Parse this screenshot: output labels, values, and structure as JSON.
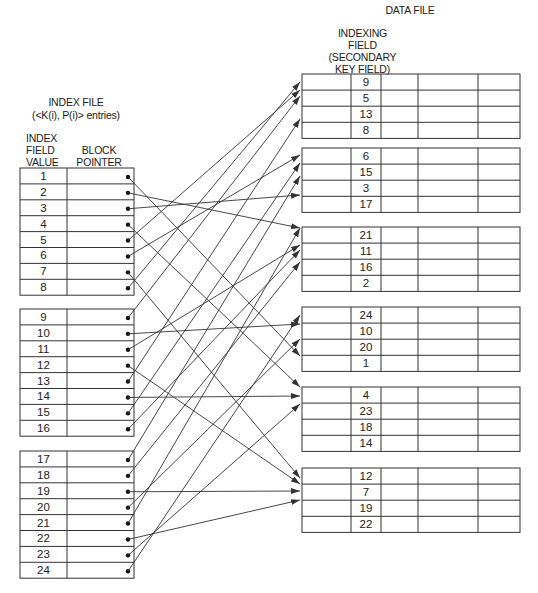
{
  "labels": {
    "data_file": "DATA FILE",
    "indexing_field": [
      "INDEXING",
      "FIELD",
      "(SECONDARY",
      "KEY FIELD)"
    ],
    "index_file": "INDEX FILE",
    "index_entries": "(<K(i), P(i)> entries)",
    "index_field_value": [
      "INDEX",
      "FIELD",
      "VALUE"
    ],
    "block_pointer": [
      "BLOCK",
      "POINTER"
    ]
  },
  "index_file": {
    "blocks": [
      {
        "values": [
          "1",
          "2",
          "3",
          "4",
          "5",
          "6",
          "7",
          "8"
        ]
      },
      {
        "values": [
          "9",
          "10",
          "11",
          "12",
          "13",
          "14",
          "15",
          "16"
        ]
      },
      {
        "values": [
          "17",
          "18",
          "19",
          "20",
          "21",
          "22",
          "23",
          "24"
        ]
      }
    ]
  },
  "data_file": {
    "blocks": [
      {
        "keys": [
          "9",
          "5",
          "13",
          "8"
        ]
      },
      {
        "keys": [
          "6",
          "15",
          "3",
          "17"
        ]
      },
      {
        "keys": [
          "21",
          "11",
          "16",
          "2"
        ]
      },
      {
        "keys": [
          "24",
          "10",
          "20",
          "1"
        ]
      },
      {
        "keys": [
          "4",
          "23",
          "18",
          "14"
        ]
      },
      {
        "keys": [
          "12",
          "7",
          "19",
          "22"
        ]
      }
    ]
  },
  "pointers": {
    "1": 3,
    "2": 2,
    "3": 1,
    "4": 4,
    "5": 0,
    "6": 1,
    "7": 5,
    "8": 0,
    "9": 0,
    "10": 3,
    "11": 2,
    "12": 5,
    "13": 0,
    "14": 4,
    "15": 1,
    "16": 2,
    "17": 1,
    "18": 2,
    "19": 5,
    "20": 3,
    "21": 2,
    "22": 5,
    "23": 4,
    "24": 3
  },
  "arrow_targets_y": {
    "1": 356,
    "2": 228,
    "3": 195,
    "4": 387,
    "5": 90,
    "6": 155,
    "7": 478,
    "8": 82,
    "9": 96,
    "10": 324,
    "11": 245,
    "12": 484,
    "13": 119,
    "14": 396,
    "15": 163,
    "16": 250,
    "17": 176,
    "18": 262,
    "19": 491,
    "20": 339,
    "21": 228,
    "22": 500,
    "23": 404,
    "24": 315
  },
  "colors": {
    "line": "#333333",
    "text": "#222222",
    "background": "#ffffff"
  }
}
